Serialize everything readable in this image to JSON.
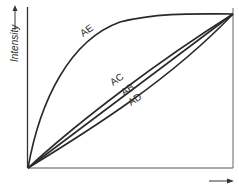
{
  "diagram": {
    "y_axis_label": "Intensity",
    "x_axis_label": "",
    "curves": [
      {
        "name": "AE",
        "label": "AE",
        "shape": "concave"
      },
      {
        "name": "AC",
        "label": "AC",
        "shape": "slightly concave"
      },
      {
        "name": "AB",
        "label": "AB",
        "shape": "linear"
      },
      {
        "name": "AD",
        "label": "AD",
        "shape": "convex"
      }
    ],
    "colors": {
      "line": "#2a2a2a",
      "background": "#ffffff"
    }
  }
}
